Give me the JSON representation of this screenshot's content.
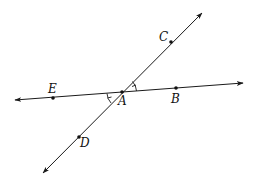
{
  "diagram": {
    "type": "intersecting-lines",
    "colors": {
      "line": "#1a1a1a",
      "point": "#111111",
      "label": "#111111",
      "background": "#ffffff"
    },
    "lines": [
      {
        "id": "line-EB",
        "through": [
          "E",
          "A",
          "B"
        ],
        "from": [
          15,
          100
        ],
        "to": [
          243,
          83
        ],
        "arrows": "both"
      },
      {
        "id": "line-DC",
        "through": [
          "D",
          "A",
          "C"
        ],
        "from": [
          43,
          173
        ],
        "to": [
          202,
          13
        ],
        "arrows": "both"
      }
    ],
    "points": [
      {
        "id": "A",
        "label": "A",
        "x": 122,
        "y": 92,
        "label_x": 119,
        "label_y": 104
      },
      {
        "id": "B",
        "label": "B",
        "x": 176,
        "y": 88,
        "label_x": 172,
        "label_y": 102
      },
      {
        "id": "C",
        "label": "C",
        "x": 171,
        "y": 42,
        "label_x": 160,
        "label_y": 41
      },
      {
        "id": "D",
        "label": "D",
        "x": 79,
        "y": 137,
        "label_x": 80,
        "label_y": 146
      },
      {
        "id": "E",
        "label": "E",
        "x": 53,
        "y": 98,
        "label_x": 49,
        "label_y": 93
      }
    ],
    "angle_marks": [
      {
        "id": "angle-CAB",
        "vertex": "A",
        "between": [
          "C",
          "B"
        ],
        "description": "single arc with tick"
      },
      {
        "id": "angle-EAD",
        "vertex": "A",
        "between": [
          "E",
          "D"
        ],
        "description": "single arc with tick"
      }
    ]
  },
  "labels": {
    "A": "A",
    "B": "B",
    "C": "C",
    "D": "D",
    "E": "E"
  }
}
